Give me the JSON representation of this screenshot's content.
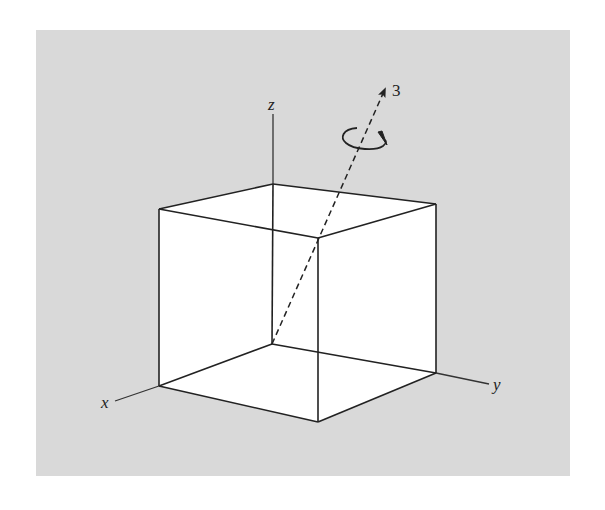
{
  "figure": {
    "background_color": "#d9d9d9",
    "cube_face_color": "#ffffff",
    "line_color": "#222222",
    "axes": {
      "x_label": "x",
      "y_label": "y",
      "z_label": "z"
    },
    "rotation_axis": {
      "label": "3",
      "style": "dashed",
      "has_rotation_arrow": true
    }
  }
}
